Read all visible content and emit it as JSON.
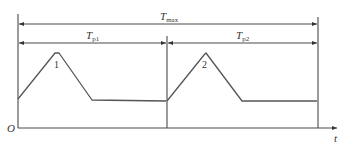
{
  "diagram": {
    "labels": {
      "t_max": "T",
      "t_max_sub": "max",
      "t_p1": "T",
      "t_p1_sub": "p1",
      "t_p2": "T",
      "t_p2_sub": "p2",
      "origin": "O",
      "time_axis": "t",
      "peak1": "1",
      "peak2": "2"
    },
    "colors": {
      "line": "#4a4a4a",
      "background": "#ffffff"
    }
  }
}
